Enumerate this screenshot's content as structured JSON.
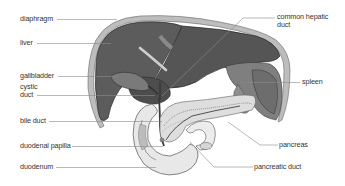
{
  "diagram": {
    "type": "anatomical-illustration",
    "colors": {
      "liver": "#5a5a5a",
      "liver_dark": "#474747",
      "diaphragm": "#b9b9b9",
      "spleen": "#7d7d7d",
      "pancreas": "#dcdcdc",
      "duodenum": "#e6e6e6",
      "leader_line": "#8a8a8a",
      "label_text": "#333333",
      "background": "#ffffff"
    },
    "labels_left": [
      {
        "id": "diaphragm",
        "text": "diaphragm"
      },
      {
        "id": "liver",
        "text": "liver"
      },
      {
        "id": "gallbladder",
        "text": "gallbladder"
      },
      {
        "id": "cystic-duct",
        "text_line1": "cystic",
        "text_line2": "duct"
      },
      {
        "id": "bile-duct",
        "text": "bile duct"
      },
      {
        "id": "duodenal-papilla",
        "text": "duodenal papilla"
      },
      {
        "id": "duodenum",
        "text": "duodenum"
      }
    ],
    "labels_right": [
      {
        "id": "common-hepatic-duct",
        "text_line1": "common hepatic",
        "text_line2": "duct"
      },
      {
        "id": "spleen",
        "text": "spleen"
      },
      {
        "id": "pancreas",
        "text": "pancreas"
      },
      {
        "id": "pancreatic-duct",
        "text": "pancreatic duct"
      }
    ]
  }
}
